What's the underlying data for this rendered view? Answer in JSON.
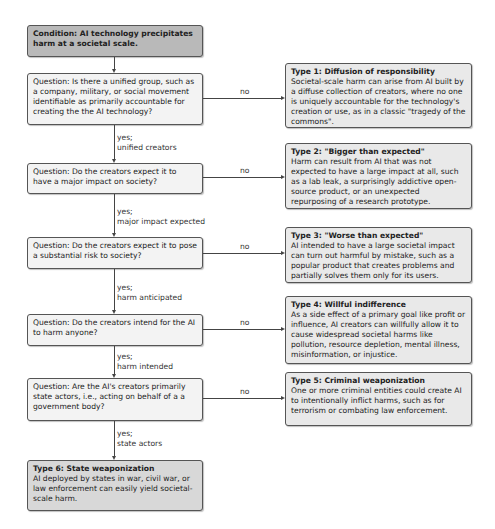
{
  "condition": {
    "text": "Condition: AI technology precipitates harm at a societal scale."
  },
  "questions": [
    {
      "text": "Question: Is there a unified group, such as a company, military, or social movement identifiable as primarily accountable for creating the the AI technology?",
      "yes_label": "yes;",
      "yes_detail": "unified creators",
      "no_label": "no"
    },
    {
      "text": "Question: Do the creators expect it to have a major impact on society?",
      "yes_label": "yes;",
      "yes_detail": "major impact expected",
      "no_label": "no"
    },
    {
      "text": "Question: Do the creators expect it to pose a substantial risk to society?",
      "yes_label": "yes;",
      "yes_detail": "harm anticipated",
      "no_label": "no"
    },
    {
      "text": "Question: Do the creators intend for the AI to harm anyone?",
      "yes_label": "yes;",
      "yes_detail": "harm intended",
      "no_label": "no"
    },
    {
      "text": "Question: Are the AI's creators primarily state actors, i.e., acting on behalf of a a government body?",
      "yes_label": "yes;",
      "yes_detail": "state actors",
      "no_label": "no"
    }
  ],
  "types": [
    {
      "title": "Type 1: Diffusion of responsibility",
      "body": "Societal-scale harm can arise from AI built by a diffuse collection of creators, where no one is uniquely accountable for the technology's creation or use, as in a classic \"tragedy of the commons\"."
    },
    {
      "title": "Type 2: \"Bigger than expected\"",
      "body": "Harm can result from AI that was not expected to have a large impact at all, such as a lab leak, a surprisingly addictive open-source product, or an unexpected repurposing of a research prototype."
    },
    {
      "title": "Type 3: \"Worse than expected\"",
      "body": "AI intended to have a large societal impact can turn out harmful by mistake, such as a popular product that creates problems and partially solves them only for its users."
    },
    {
      "title": "Type 4: Willful indifference",
      "body": "As a side effect of a primary goal like profit or influence, AI creators can willfully allow it to cause widespread societal harms like pollution, resource depletion, mental illness, misinformation, or injustice."
    },
    {
      "title": "Type 5: Criminal weaponization",
      "body": "One or more criminal entities could create AI to intentionally inflict harms, such as for terrorism or combating law enforcement."
    },
    {
      "title": "Type 6: State weaponization",
      "body": "AI deployed by states in war, civil war, or law enforcement can easily yield societal-scale harm."
    }
  ]
}
